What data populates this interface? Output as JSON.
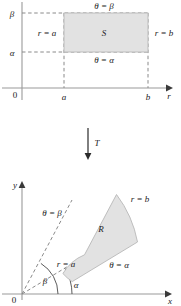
{
  "figure": {
    "caption_absent": true,
    "transform_label": "T",
    "fill_color": "#e2e2e2",
    "stroke_color": "#6e6e6e",
    "axis_color": "#9a9a9a"
  },
  "top_panel": {
    "name": "polar-parameter-plane",
    "origin_label": "0",
    "x_axis_label": "r",
    "y_axis_label": "",
    "x_ticks": [
      "a",
      "b"
    ],
    "y_ticks": [
      "α",
      "β"
    ],
    "region_label": "S",
    "edge_labels": {
      "top": "θ = β",
      "bottom": "θ = α",
      "left": "r = a",
      "right": "r = b"
    }
  },
  "bottom_panel": {
    "name": "cartesian-image-plane",
    "origin_label": "0",
    "x_axis_label": "x",
    "y_axis_label": "y",
    "region_label": "R",
    "edge_labels": {
      "outer_arc": "r = b",
      "inner_arc": "r = a",
      "upper_ray": "θ = β",
      "lower_ray": "θ = α"
    },
    "angle_labels": {
      "alpha": "α",
      "beta": "β"
    }
  }
}
